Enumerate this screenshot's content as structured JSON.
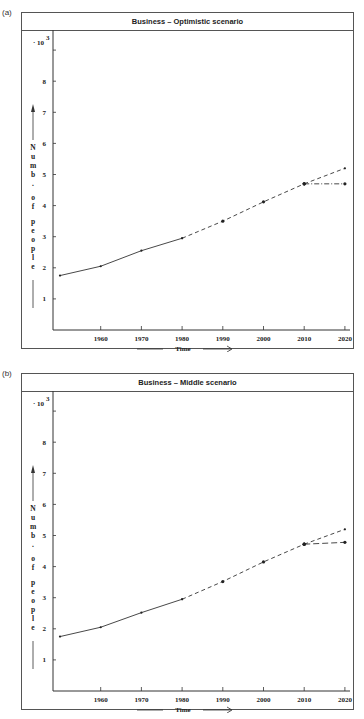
{
  "chart_data": [
    {
      "panel_label": "(a)",
      "type": "line",
      "title": "Business – Optimistic scenario",
      "xlabel": "Time",
      "ylabel": "Numb. of people",
      "y_multiplier": "· 10",
      "y_multiplier_exp": "3",
      "x_ticks": [
        "1960",
        "1970",
        "1980",
        "1990",
        "2000",
        "2010",
        "2020"
      ],
      "y_ticks": [
        "1",
        "2",
        "3",
        "4",
        "5",
        "6",
        "7",
        "8"
      ],
      "xlim": [
        1948,
        2023
      ],
      "ylim": [
        0,
        9
      ],
      "series": [
        {
          "name": "historical",
          "style": "solid",
          "x": [
            1950,
            1960,
            1970,
            1980
          ],
          "y": [
            1.75,
            2.05,
            2.55,
            2.95
          ]
        },
        {
          "name": "projection",
          "style": "dashed",
          "x": [
            1980,
            1990,
            2000,
            2010
          ],
          "y": [
            2.95,
            3.5,
            4.12,
            4.7
          ]
        },
        {
          "name": "upper scenario",
          "style": "dashed",
          "x": [
            2010,
            2020
          ],
          "y": [
            4.7,
            5.2
          ]
        },
        {
          "name": "lower scenario",
          "style": "dash-dot",
          "x": [
            2010,
            2020
          ],
          "y": [
            4.7,
            4.7
          ]
        }
      ]
    },
    {
      "panel_label": "(b)",
      "type": "line",
      "title": "Business – Middle scenario",
      "xlabel": "Time",
      "ylabel": "Numb. of people",
      "y_multiplier": "· 10",
      "y_multiplier_exp": "3",
      "x_ticks": [
        "1960",
        "1970",
        "1980",
        "1990",
        "2000",
        "2010",
        "2020"
      ],
      "y_ticks": [
        "1",
        "2",
        "3",
        "4",
        "5",
        "6",
        "7",
        "8"
      ],
      "xlim": [
        1948,
        2023
      ],
      "ylim": [
        0,
        9
      ],
      "series": [
        {
          "name": "historical",
          "style": "solid",
          "x": [
            1950,
            1960,
            1970,
            1980
          ],
          "y": [
            1.75,
            2.05,
            2.52,
            2.95
          ]
        },
        {
          "name": "projection",
          "style": "dashed",
          "x": [
            1980,
            1990,
            2000,
            2010
          ],
          "y": [
            2.95,
            3.52,
            4.15,
            4.72
          ]
        },
        {
          "name": "upper scenario",
          "style": "dashed",
          "x": [
            2010,
            2020
          ],
          "y": [
            4.72,
            5.2
          ]
        },
        {
          "name": "lower scenario",
          "style": "long-dash",
          "x": [
            2010,
            2020
          ],
          "y": [
            4.72,
            4.78
          ]
        }
      ]
    }
  ]
}
